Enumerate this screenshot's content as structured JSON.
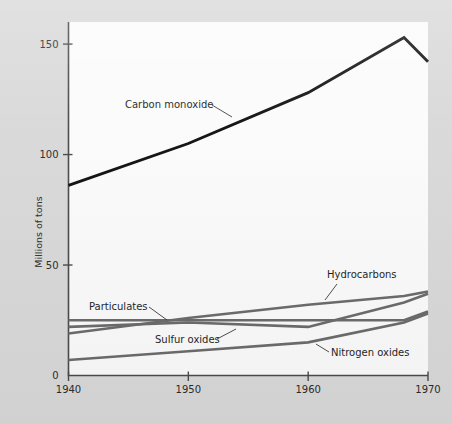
{
  "chart_data": {
    "type": "line",
    "title": "",
    "subtitle": "",
    "xlabel": "",
    "ylabel": "Millions of tons",
    "xlim": [
      1940,
      1970
    ],
    "ylim": [
      0,
      160
    ],
    "grid": false,
    "legend_position": "inline-annotations",
    "x_ticks": [
      "1940",
      "1950",
      "1960",
      "1970"
    ],
    "x_tick_values": [
      1940,
      1950,
      1960,
      1970
    ],
    "y_ticks": [
      "0",
      "50",
      "100",
      "150"
    ],
    "y_tick_values": [
      0,
      50,
      100,
      150
    ],
    "series": [
      {
        "name": "Carbon monoxide",
        "color": "#111111",
        "width": 2.9,
        "x": [
          1940,
          1950,
          1960,
          1968,
          1970
        ],
        "values": [
          86,
          105,
          128,
          153,
          142
        ]
      },
      {
        "name": "Particulates",
        "color": "#6b6b6b",
        "width": 2.6,
        "x": [
          1940,
          1950,
          1960,
          1968,
          1970
        ],
        "values": [
          25,
          25,
          25,
          25,
          29
        ]
      },
      {
        "name": "Sulfur oxides",
        "color": "#6b6b6b",
        "width": 2.6,
        "x": [
          1940,
          1950,
          1960,
          1968,
          1970
        ],
        "values": [
          22,
          24,
          22,
          33,
          37
        ]
      },
      {
        "name": "Hydrocarbons",
        "color": "#6b6b6b",
        "width": 2.6,
        "x": [
          1940,
          1950,
          1960,
          1968,
          1970
        ],
        "values": [
          19,
          26,
          32,
          36,
          38
        ]
      },
      {
        "name": "Nitrogen oxides",
        "color": "#6b6b6b",
        "width": 2.6,
        "x": [
          1940,
          1950,
          1960,
          1968,
          1970
        ],
        "values": [
          7,
          11,
          15,
          24,
          28
        ]
      }
    ],
    "annotations": [
      {
        "text": "Carbon monoxide",
        "label_x": 125,
        "label_y": 108,
        "anchor": "start",
        "leader": [
          [
            212,
            105
          ],
          [
            232,
            117
          ]
        ]
      },
      {
        "text": "Particulates",
        "label_x": 89,
        "label_y": 310,
        "anchor": "start",
        "leader": [
          [
            149,
            307
          ],
          [
            167,
            320
          ]
        ]
      },
      {
        "text": "Sulfur oxides",
        "label_x": 155,
        "label_y": 343,
        "anchor": "start",
        "leader": [
          [
            217,
            339
          ],
          [
            236,
            329
          ]
        ]
      },
      {
        "text": "Hydrocarbons",
        "label_x": 327,
        "label_y": 278,
        "anchor": "start",
        "leader": [
          [
            337,
            284
          ],
          [
            325,
            300
          ]
        ]
      },
      {
        "text": "Nitrogen oxides",
        "label_x": 331,
        "label_y": 356,
        "anchor": "start",
        "leader": [
          [
            329,
            352
          ],
          [
            316,
            344
          ]
        ]
      }
    ]
  },
  "colors": {
    "page_background": "#d9d9d9",
    "plot_background": "#fbfbfb",
    "axis": "#4a4a4a",
    "primary_series": "#111111",
    "secondary_series": "#6b6b6b"
  },
  "ylabel_text": "Millions of tons"
}
